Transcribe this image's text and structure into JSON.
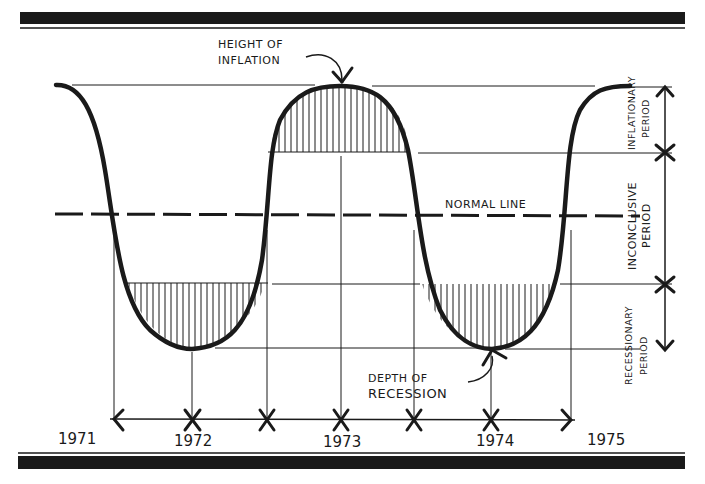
{
  "diagram": {
    "type": "business-cycle-wave",
    "annotations": {
      "peak_label_line1": "HEIGHT OF",
      "peak_label_line2": "INFLATION",
      "trough_label_line1": "DEPTH OF",
      "trough_label_line2": "RECESSION",
      "normal_line_label": "NORMAL LINE"
    },
    "periods": {
      "inflationary_line1": "INFLATIONARY",
      "inflationary_line2": "PERIOD",
      "inconclusive_line1": "INCONCLUSIVE",
      "inconclusive_line2": "PERIOD",
      "recessionary_line1": "RECESSIONARY",
      "recessionary_line2": "PERIOD"
    },
    "timeline": {
      "years": [
        "1971",
        "1972",
        "1973",
        "1974",
        "1975"
      ]
    },
    "colors": {
      "ink": "#1a1a1a",
      "background": "#ffffff"
    }
  }
}
